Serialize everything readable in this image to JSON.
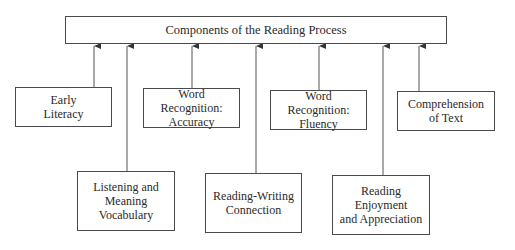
{
  "diagram": {
    "title": "Components of the Reading Process",
    "components": [
      {
        "id": "early-literacy",
        "label": "Early\nLiteracy",
        "row": "upper"
      },
      {
        "id": "listening-meaning-vocabulary",
        "label": "Listening and\nMeaning\nVocabulary",
        "row": "lower"
      },
      {
        "id": "word-recognition-accuracy",
        "label": "Word\nRecognition:\nAccuracy",
        "row": "upper"
      },
      {
        "id": "reading-writing-connection",
        "label": "Reading-Writing\nConnection",
        "row": "lower"
      },
      {
        "id": "word-recognition-fluency",
        "label": "Word\nRecognition:\nFluency",
        "row": "upper"
      },
      {
        "id": "reading-enjoyment-appreciation",
        "label": "Reading\nEnjoyment\nand Appreciation",
        "row": "lower"
      },
      {
        "id": "comprehension-of-text",
        "label": "Comprehension\nof Text",
        "row": "upper"
      }
    ],
    "edges": [
      {
        "from": "early-literacy",
        "to": "title"
      },
      {
        "from": "listening-meaning-vocabulary",
        "to": "title"
      },
      {
        "from": "word-recognition-accuracy",
        "to": "title"
      },
      {
        "from": "reading-writing-connection",
        "to": "title"
      },
      {
        "from": "word-recognition-fluency",
        "to": "title"
      },
      {
        "from": "reading-enjoyment-appreciation",
        "to": "title"
      },
      {
        "from": "comprehension-of-text",
        "to": "title"
      }
    ]
  }
}
